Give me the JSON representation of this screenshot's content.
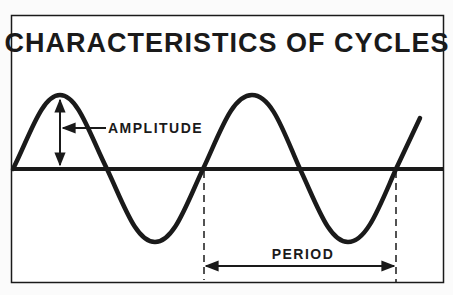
{
  "title": "CHARACTERISTICS OF CYCLES",
  "labels": {
    "amplitude": "AMPLITUDE",
    "period": "PERIOD"
  },
  "colors": {
    "ink": "#1a1a1a",
    "background": "#fbfbfb"
  }
}
